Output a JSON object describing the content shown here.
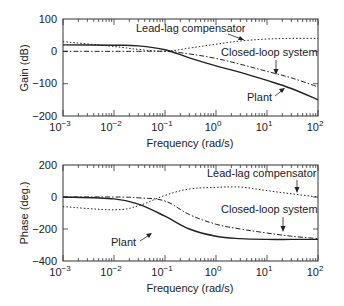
{
  "chart_data": [
    {
      "type": "line",
      "title": "",
      "xlabel": "Frequency (rad/s)",
      "ylabel": "Gain (dB)",
      "xscale": "log",
      "xlim": [
        0.001,
        100
      ],
      "ylim": [
        -200,
        100
      ],
      "grid": false,
      "x_tick_labels": [
        "10^-3",
        "10^-2",
        "10^-1",
        "10^0",
        "10^1",
        "10^2"
      ],
      "y_tick_labels": [
        "100",
        "0",
        "-100",
        "-200"
      ],
      "x": [
        0.001,
        0.01,
        0.03,
        0.1,
        0.3,
        1,
        3,
        10,
        30,
        100
      ],
      "series": [
        {
          "name": "Plant",
          "style": "solid",
          "values": [
            20,
            19,
            17,
            5,
            -20,
            -45,
            -65,
            -90,
            -115,
            -150
          ]
        },
        {
          "name": "Lead-lag compensator",
          "style": "dotted",
          "values": [
            30,
            15,
            6,
            0,
            10,
            22,
            32,
            38,
            40,
            40
          ]
        },
        {
          "name": "Closed-loop system",
          "style": "dash-dot",
          "values": [
            0,
            0,
            0,
            0,
            -8,
            -22,
            -40,
            -62,
            -82,
            -110
          ]
        }
      ],
      "annotations": [
        "Lead-lag compensator",
        "Closed-loop system",
        "Plant"
      ]
    },
    {
      "type": "line",
      "title": "",
      "xlabel": "Frequency (rad/s)",
      "ylabel": "Phase (deg.)",
      "xscale": "log",
      "xlim": [
        0.001,
        100
      ],
      "ylim": [
        -400,
        200
      ],
      "grid": false,
      "x_tick_labels": [
        "10^-3",
        "10^-2",
        "10^-1",
        "10^0",
        "10^1",
        "10^2"
      ],
      "y_tick_labels": [
        "200",
        "0",
        "-200",
        "-400"
      ],
      "x": [
        0.001,
        0.01,
        0.03,
        0.1,
        0.3,
        1,
        3,
        10,
        30,
        100
      ],
      "series": [
        {
          "name": "Plant",
          "style": "solid",
          "values": [
            0,
            -12,
            -45,
            -120,
            -200,
            -245,
            -260,
            -265,
            -265,
            -265
          ]
        },
        {
          "name": "Lead-lag compensator",
          "style": "dotted",
          "values": [
            -60,
            -80,
            -55,
            10,
            50,
            60,
            62,
            40,
            20,
            0
          ]
        },
        {
          "name": "Closed-loop system",
          "style": "dash-dot",
          "values": [
            0,
            0,
            -5,
            -25,
            -110,
            -170,
            -200,
            -225,
            -245,
            -260
          ]
        }
      ],
      "annotations": [
        "Lead-lag compensator",
        "Closed-loop system",
        "Plant"
      ]
    }
  ],
  "gain_plot": {
    "ylabel": "Gain (dB)",
    "xlabel": "Frequency (rad/s)",
    "yticks": [
      "100",
      "0",
      "−100",
      "−200"
    ],
    "labels": {
      "compensator": "Lead-lag compensator",
      "closed": "Closed-loop system",
      "plant": "Plant"
    }
  },
  "phase_plot": {
    "ylabel": "Phase (deg.)",
    "xlabel": "Frequency (rad/s)",
    "yticks": [
      "200",
      "0",
      "−200",
      "−400"
    ],
    "labels": {
      "compensator": "Lead-lag compensator",
      "closed": "Closed-loop system",
      "plant": "Plant"
    }
  },
  "xticks": {
    "base": "10",
    "exps": [
      "−3",
      "−2",
      "−1",
      "0",
      "1",
      "2"
    ]
  }
}
